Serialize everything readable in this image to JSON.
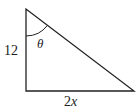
{
  "diagram": {
    "type": "right-triangle",
    "vertices": {
      "top": [
        26,
        9
      ],
      "right_angle": [
        26,
        91
      ],
      "bottom_right": [
        134,
        91
      ]
    },
    "labels": {
      "vertical_side": "12",
      "angle": "θ",
      "base_number": "2",
      "base_variable": "x"
    },
    "colors": {
      "stroke": "#222222",
      "background": "#ffffff"
    }
  }
}
